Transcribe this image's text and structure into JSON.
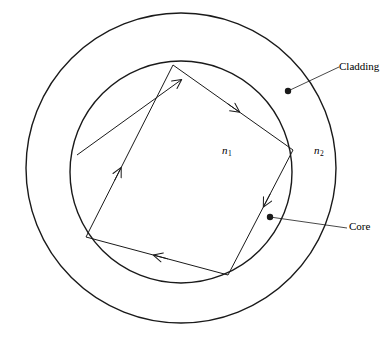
{
  "figure": {
    "type": "optical-fiber-cross-section-ray-diagram",
    "background_color": "#ffffff",
    "stroke_color": "#1a1a1a",
    "width": 392,
    "height": 346
  },
  "labels": {
    "cladding": "Cladding",
    "core": "Core",
    "n1_symbol": "n",
    "n1_subscript": "1",
    "n2_symbol": "n",
    "n2_subscript": "2"
  },
  "geometry": {
    "outer_circle": {
      "cx": 181,
      "cy": 168,
      "r": 155
    },
    "inner_circle": {
      "cx": 181,
      "cy": 172,
      "r": 111
    },
    "ray_vertices": [
      {
        "name": "top",
        "x": 173,
        "y": 65
      },
      {
        "name": "right",
        "x": 293,
        "y": 150
      },
      {
        "name": "bottom-right",
        "x": 228,
        "y": 275
      },
      {
        "name": "bottom-left",
        "x": 86,
        "y": 237
      },
      {
        "name": "left-entry",
        "x": 99,
        "y": 140
      }
    ],
    "incoming_ray": {
      "x1": 77,
      "y1": 155,
      "x2": 185,
      "y2": 77
    },
    "leader_cladding": {
      "dot_x": 288,
      "dot_y": 91,
      "x2": 338,
      "y2": 67
    },
    "leader_core": {
      "dot_x": 270,
      "dot_y": 217,
      "x2": 347,
      "y2": 228
    }
  },
  "chart_data": {
    "type": "diagram",
    "title": "",
    "regions": [
      {
        "label": "Core",
        "refractive_index": "n1",
        "shape": "inner circle"
      },
      {
        "label": "Cladding",
        "refractive_index": "n2",
        "shape": "outer annulus"
      }
    ],
    "annotations": [
      "Cladding",
      "Core",
      "n1",
      "n2"
    ]
  }
}
